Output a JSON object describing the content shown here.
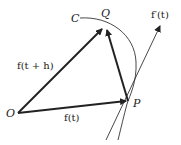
{
  "diagram": {
    "points": {
      "O": "O",
      "P": "P",
      "Q": "Q",
      "C": "C"
    },
    "labels": {
      "f_t": "f(t)",
      "f_t_plus_h": "f(t + h)",
      "f_prime_t": "f′(t)"
    },
    "colors": {
      "stroke": "#222222",
      "background": "#ffffff"
    }
  }
}
